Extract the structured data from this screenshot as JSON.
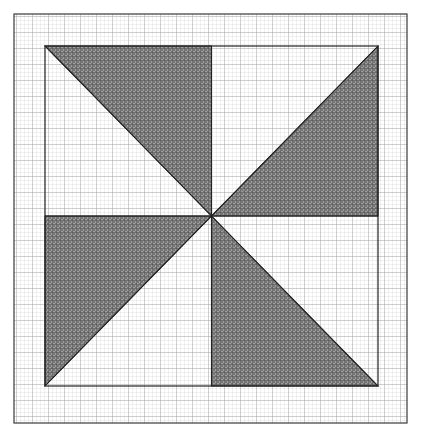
{
  "canvas": {
    "width": 421,
    "height": 439,
    "background_color": "#ffffff",
    "title": "Pinwheel shaded figure on graph paper"
  },
  "colors": {
    "paper": "#ffffff",
    "minor_grid": "#c9c9c9",
    "major_grid": "#9a9a9a",
    "border_stroke": "#3a3a3a",
    "shape_stroke": "#222222",
    "shaded_fill": "#8a8a8a",
    "shaded_hatch": "#4a4a4a"
  },
  "grid": {
    "minor_spacing_px": 4,
    "major_every_n_minor": 4,
    "major_spacing_px": 16,
    "minor_line_width_px": 0.5,
    "major_line_width_px": 0.7,
    "extent": "full-bordered-region"
  },
  "outer_border": {
    "name": "outer-border",
    "x": 14,
    "y": 14,
    "width": 393,
    "height": 409,
    "stroke_width_px": 1.2
  },
  "inner_square": {
    "name": "inner-square",
    "left": 45,
    "top": 46,
    "right": 378,
    "bottom": 386,
    "width": 333,
    "height": 340,
    "stroke_width_px": 1.2
  },
  "center_point": {
    "name": "pinwheel-center",
    "x": 211.5,
    "y": 216
  },
  "chart_data": {
    "type": "diagram",
    "symmetry": "4-fold rotational (C4)",
    "shaded_area_fraction": 0.5,
    "triangle_count": 4,
    "triangles": [
      {
        "id": "triangle-top-left",
        "quadrant": "top-left",
        "shaded": true,
        "vertices": [
          [
            45,
            46
          ],
          [
            211.5,
            46
          ],
          [
            211.5,
            216
          ]
        ],
        "legs": [
          "top edge of square from left corner to top-center",
          "vertical center line from top to center"
        ],
        "hypotenuse": "from top-left corner (45,46) to center (211.5,216)",
        "leg_lengths_px": [
          166.5,
          170
        ]
      },
      {
        "id": "triangle-top-right",
        "quadrant": "top-right",
        "shaded": true,
        "vertices": [
          [
            378,
            46
          ],
          [
            378,
            216
          ],
          [
            211.5,
            216
          ]
        ],
        "legs": [
          "right edge of square from top corner to right-middle",
          "horizontal center line from right to center"
        ],
        "hypotenuse": "from top-right corner (378,46) to center (211.5,216)",
        "leg_lengths_px": [
          170,
          166.5
        ]
      },
      {
        "id": "triangle-bottom-right",
        "quadrant": "bottom-right",
        "shaded": true,
        "vertices": [
          [
            211.5,
            386
          ],
          [
            378,
            386
          ],
          [
            211.5,
            216
          ]
        ],
        "legs": [
          "bottom edge of square from bottom-center to right corner",
          "vertical center line from center to bottom"
        ],
        "hypotenuse": "from bottom-right corner (378,386) to center (211.5,216)",
        "leg_lengths_px": [
          166.5,
          170
        ]
      },
      {
        "id": "triangle-bottom-left",
        "quadrant": "bottom-left",
        "shaded": true,
        "vertices": [
          [
            45,
            216
          ],
          [
            45,
            386
          ],
          [
            211.5,
            216
          ]
        ],
        "legs": [
          "left edge of square from left-middle to bottom corner",
          "horizontal center line from left to center"
        ],
        "hypotenuse": "from bottom-left corner (45,386) to center (211.5,216)",
        "leg_lengths_px": [
          170,
          166.5
        ]
      }
    ],
    "unshaded_triangles": [
      {
        "id": "blank-top-left",
        "quadrant": "top-left",
        "vertices": [
          [
            45,
            46
          ],
          [
            45,
            216
          ],
          [
            211.5,
            216
          ]
        ]
      },
      {
        "id": "blank-top-right",
        "quadrant": "top-right",
        "vertices": [
          [
            211.5,
            46
          ],
          [
            378,
            46
          ],
          [
            211.5,
            216
          ]
        ]
      },
      {
        "id": "blank-bottom-right",
        "quadrant": "bottom-right",
        "vertices": [
          [
            378,
            216
          ],
          [
            378,
            386
          ],
          [
            211.5,
            216
          ]
        ]
      },
      {
        "id": "blank-bottom-left",
        "quadrant": "bottom-left",
        "vertices": [
          [
            45,
            386
          ],
          [
            211.5,
            386
          ],
          [
            211.5,
            216
          ]
        ]
      }
    ],
    "interior_lines": [
      {
        "id": "vertical-center-line",
        "from": [
          211.5,
          46
        ],
        "to": [
          211.5,
          386
        ]
      },
      {
        "id": "horizontal-center-line",
        "from": [
          45,
          216
        ],
        "to": [
          378,
          216
        ]
      },
      {
        "id": "diagonal-top-left-to-center",
        "from": [
          45,
          46
        ],
        "to": [
          211.5,
          216
        ]
      },
      {
        "id": "diagonal-top-right-to-center",
        "from": [
          378,
          46
        ],
        "to": [
          211.5,
          216
        ]
      },
      {
        "id": "diagonal-bottom-left-to-center",
        "from": [
          45,
          386
        ],
        "to": [
          211.5,
          216
        ]
      },
      {
        "id": "diagonal-bottom-right-to-center",
        "from": [
          378,
          386
        ],
        "to": [
          211.5,
          216
        ]
      }
    ],
    "labels": [],
    "annotations": [],
    "legend": null,
    "axes": null
  }
}
